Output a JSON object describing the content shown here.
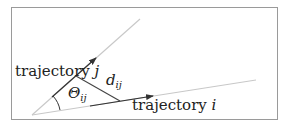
{
  "diagram": {
    "type": "geometry",
    "labels": {
      "trajectory_j": {
        "text": "trajectory",
        "var": "j"
      },
      "trajectory_i": {
        "text": "trajectory",
        "var": "i"
      },
      "angle": {
        "symbol": "Θ",
        "sub": "ij"
      },
      "distance": {
        "symbol": "d",
        "sub": "ij"
      }
    },
    "colors": {
      "border": "#9a9a9a",
      "guide_line": "#c8c8c8",
      "segment": "#333333",
      "text": "#222222"
    },
    "geometry": {
      "vertex": [
        32,
        115
      ],
      "line_j_end": [
        140,
        19
      ],
      "line_i_end": [
        256,
        80
      ],
      "segment_j": [
        [
          52,
          97
        ],
        [
          96,
          58
        ]
      ],
      "segment_i": [
        [
          90,
          106
        ],
        [
          153,
          96
        ]
      ],
      "perpendicular": [
        [
          76,
          76
        ],
        [
          120,
          101
        ]
      ],
      "angle_arc_radius": 28
    }
  }
}
